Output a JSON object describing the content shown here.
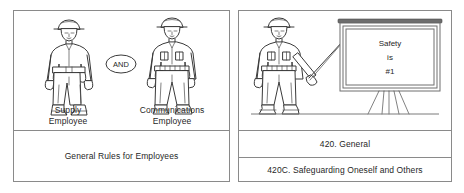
{
  "figure": {
    "panels": [
      {
        "id": "left",
        "characters": [
          {
            "name": "supply-employee",
            "caption": "Supply\nEmployee",
            "icon": "worker-hardhat-toolbelt-icon"
          },
          {
            "name": "communications-employee",
            "caption": "Communications\nEmployee",
            "icon": "worker-hardhat-vest-icon"
          }
        ],
        "connector": {
          "label": "AND",
          "shape": "ellipse"
        },
        "rows": [
          {
            "name": "general-rules-row",
            "text": "General Rules for Employees"
          }
        ]
      },
      {
        "id": "right",
        "characters": [
          {
            "name": "instructor-employee",
            "caption": "",
            "icon": "worker-with-pointer-icon"
          }
        ],
        "sign": {
          "name": "safety-sign",
          "lines": [
            "Safety",
            "is",
            "#1"
          ],
          "support": "easel-tripod-icon"
        },
        "rows": [
          {
            "name": "section-420-row",
            "text": "420. General"
          },
          {
            "name": "section-420c-row",
            "text": "420C. Safeguarding Oneself and Others"
          }
        ]
      }
    ]
  },
  "colors": {
    "border": "#8a8a8a",
    "ink": "#3a3a3a",
    "text": "#1f1f1f",
    "background": "#ffffff",
    "sign_rail": "#6d6d6d"
  }
}
